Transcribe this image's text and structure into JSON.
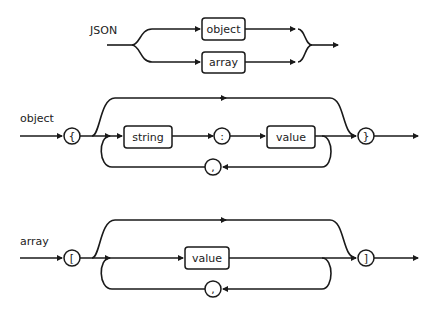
{
  "diagram": {
    "rules": [
      {
        "name": "JSON",
        "alternatives": [
          "object",
          "array"
        ]
      },
      {
        "name": "object",
        "open": "{",
        "member_key": "string",
        "separator": ":",
        "member_value": "value",
        "repeat_separator": ",",
        "close": "}"
      },
      {
        "name": "array",
        "open": "[",
        "element": "value",
        "repeat_separator": ",",
        "close": "]"
      }
    ]
  }
}
